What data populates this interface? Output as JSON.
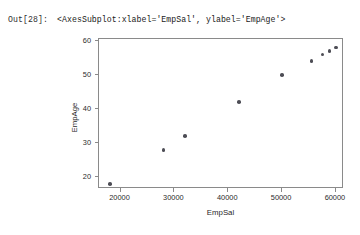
{
  "notebook": {
    "prompt_label": "Out[28]:",
    "repr_text": "<AxesSubplot:xlabel='EmpSal', ylabel='EmpAge'>"
  },
  "chart_data": {
    "type": "scatter",
    "title": "",
    "xlabel": "EmpSal",
    "ylabel": "EmpAge",
    "xlim": [
      16000,
      61500
    ],
    "ylim": [
      16.5,
      60.5
    ],
    "grid": false,
    "legend": null,
    "marker_color": "#4d4d55",
    "xticks": [
      20000,
      30000,
      40000,
      50000,
      60000
    ],
    "xtick_labels": [
      "20000",
      "30000",
      "40000",
      "50000",
      "60000"
    ],
    "yticks": [
      20,
      30,
      40,
      50,
      60
    ],
    "ytick_labels": [
      "20",
      "30",
      "40",
      "50",
      "60"
    ],
    "x": [
      18000,
      28000,
      32000,
      42000,
      50000,
      55500,
      57500,
      58800,
      60000
    ],
    "y": [
      18,
      28,
      32,
      42,
      50,
      54,
      56,
      57,
      58
    ],
    "points": [
      {
        "x": 18000,
        "y": 18
      },
      {
        "x": 28000,
        "y": 28
      },
      {
        "x": 32000,
        "y": 32
      },
      {
        "x": 42000,
        "y": 42
      },
      {
        "x": 50000,
        "y": 50
      },
      {
        "x": 55500,
        "y": 54
      },
      {
        "x": 57500,
        "y": 56
      },
      {
        "x": 58800,
        "y": 57
      },
      {
        "x": 60000,
        "y": 58
      }
    ]
  }
}
